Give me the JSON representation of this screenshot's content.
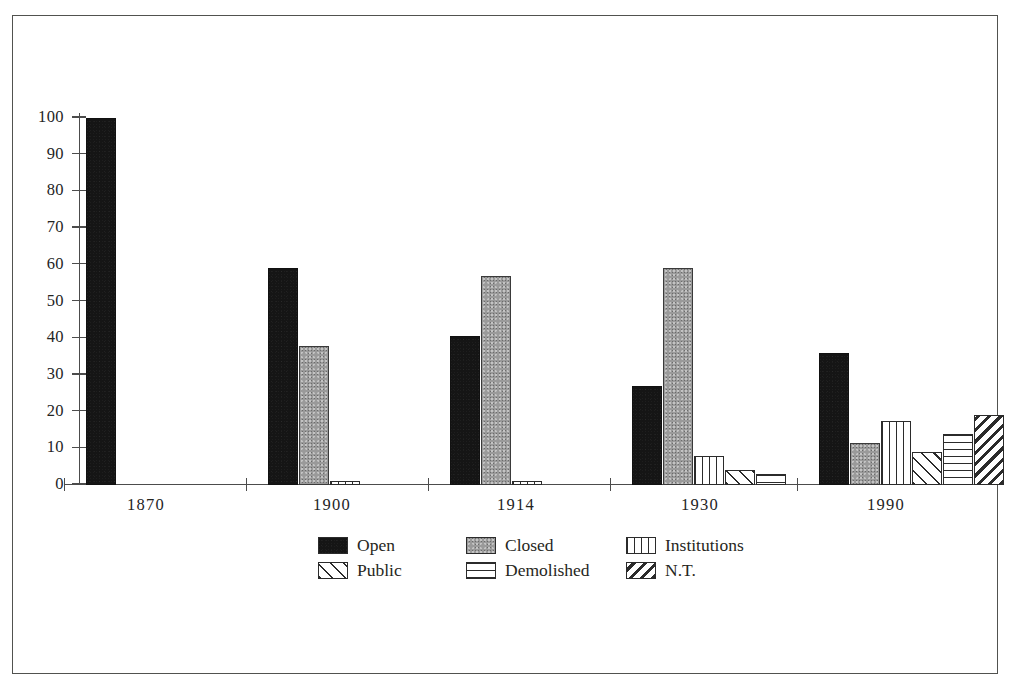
{
  "figure": {
    "frame_color": "#51524f",
    "background": "#ffffff"
  },
  "axes": {
    "y_ticks": [
      "100",
      "90",
      "80",
      "70",
      "60",
      "50",
      "40",
      "30",
      "20",
      "10",
      "0"
    ],
    "x_ticks": [
      "1870",
      "1900",
      "1914",
      "1930",
      "1990"
    ]
  },
  "legend": {
    "rows": [
      [
        {
          "key": "open",
          "label": "Open",
          "pattern": "solid-black",
          "color": "#151515"
        },
        {
          "key": "closed",
          "label": "Closed",
          "pattern": "solid-gray",
          "color": "#9a9a9a"
        },
        {
          "key": "institutions",
          "label": "Institutions",
          "pattern": "vertical-stripes",
          "color": "#2b2b2b"
        }
      ],
      [
        {
          "key": "public",
          "label": "Public",
          "pattern": "cross-hatch",
          "color": "#2b2b2b"
        },
        {
          "key": "demolished",
          "label": "Demolished",
          "pattern": "horizontal-stripes",
          "color": "#2b2b2b"
        },
        {
          "key": "nt",
          "label": "N.T.",
          "pattern": "diagonal-stripes",
          "color": "#2b2b2b"
        }
      ]
    ]
  },
  "chart_data": {
    "type": "bar",
    "title": "",
    "xlabel": "",
    "ylabel": "",
    "ylim": [
      0,
      100
    ],
    "yticks": [
      0,
      10,
      20,
      30,
      40,
      50,
      60,
      70,
      80,
      90,
      100
    ],
    "grid": false,
    "legend_position": "bottom-center",
    "categories": [
      "1870",
      "1900",
      "1914",
      "1930",
      "1990"
    ],
    "series": [
      {
        "name": "Open",
        "key": "open",
        "values": [
          100,
          59,
          40.5,
          27,
          36
        ]
      },
      {
        "name": "Closed",
        "key": "closed",
        "values": [
          0,
          38,
          57,
          59,
          11.5
        ]
      },
      {
        "name": "Institutions",
        "key": "institutions",
        "values": [
          0,
          1,
          1,
          8,
          17.5
        ]
      },
      {
        "name": "Public",
        "key": "public",
        "values": [
          0,
          0,
          0,
          4,
          9
        ]
      },
      {
        "name": "Demolished",
        "key": "demolished",
        "values": [
          0,
          0,
          0,
          3,
          14
        ]
      },
      {
        "name": "N.T.",
        "key": "nt",
        "values": [
          0,
          0,
          0,
          0,
          19
        ]
      }
    ]
  }
}
